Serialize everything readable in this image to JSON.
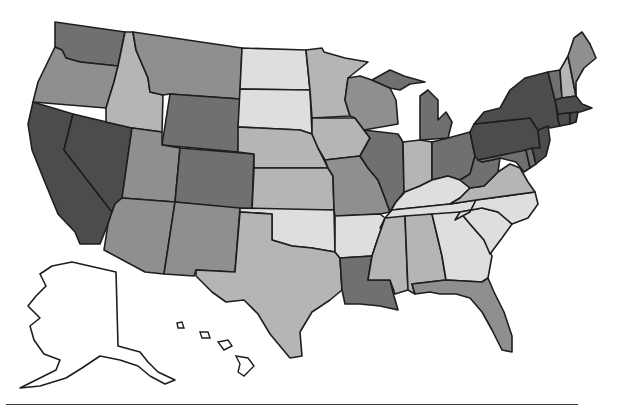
{
  "map": {
    "type": "choropleth",
    "region": "United States",
    "palette": {
      "level5": "#4c4c4c",
      "level4": "#707070",
      "level3": "#8f8f8f",
      "level2": "#b5b5b5",
      "level1": "#dedede",
      "none": "#ffffff"
    },
    "states": {
      "WA": "level4",
      "OR": "level3",
      "CA": "level5",
      "NV": "level5",
      "ID": "level2",
      "MT": "level3",
      "WY": "level4",
      "UT": "level3",
      "CO": "level4",
      "AZ": "level3",
      "NM": "level3",
      "ND": "level1",
      "SD": "level1",
      "NE": "level2",
      "KS": "level2",
      "OK": "level1",
      "TX": "level2",
      "MN": "level2",
      "IA": "level2",
      "MO": "level3",
      "AR": "level1",
      "LA": "level4",
      "WI": "level3",
      "IL": "level4",
      "MI": "level4",
      "IN": "level2",
      "OH": "level4",
      "KY": "level1",
      "TN": "level1",
      "MS": "level2",
      "AL": "level2",
      "GA": "level1",
      "FL": "level3",
      "SC": "level1",
      "NC": "level1",
      "VA": "level2",
      "WV": "level4",
      "MD": "level4",
      "DE": "level4",
      "PA": "level5",
      "NJ": "level5",
      "NY": "level5",
      "CT": "level5",
      "RI": "level5",
      "MA": "level5",
      "VT": "level4",
      "NH": "level2",
      "ME": "level3",
      "AK": "none",
      "HI": "none"
    }
  }
}
